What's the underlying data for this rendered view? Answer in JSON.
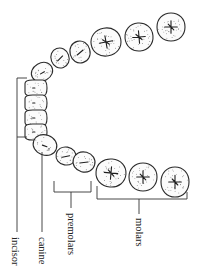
{
  "figure": {
    "type": "dental arch diagram (occlusal view, rotated)",
    "labels": {
      "incisor": "incisor",
      "canine": "canine",
      "premolars": "premolars",
      "molars": "molars"
    },
    "teeth": {
      "upper_arch": [
        {
          "kind": "canine",
          "label_group": "none"
        },
        {
          "kind": "premolar",
          "label_group": "none"
        },
        {
          "kind": "premolar",
          "label_group": "none"
        },
        {
          "kind": "molar",
          "label_group": "none"
        },
        {
          "kind": "molar",
          "label_group": "none"
        },
        {
          "kind": "molar",
          "label_group": "none"
        }
      ],
      "incisors": [
        {
          "kind": "incisor",
          "label_group": "incisor"
        },
        {
          "kind": "incisor",
          "label_group": "incisor"
        },
        {
          "kind": "incisor",
          "label_group": "incisor"
        },
        {
          "kind": "incisor",
          "label_group": "incisor"
        }
      ],
      "lower_arch": [
        {
          "kind": "canine",
          "label_group": "canine"
        },
        {
          "kind": "premolar",
          "label_group": "premolars"
        },
        {
          "kind": "premolar",
          "label_group": "premolars"
        },
        {
          "kind": "molar",
          "label_group": "molars"
        },
        {
          "kind": "molar",
          "label_group": "molars"
        },
        {
          "kind": "molar",
          "label_group": "molars"
        }
      ]
    },
    "colors": {
      "ink": "#2a2a2a",
      "background": "#ffffff"
    }
  }
}
